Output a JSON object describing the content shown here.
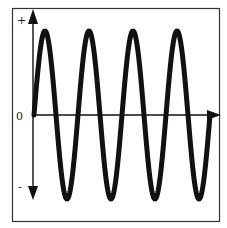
{
  "diagram": {
    "title": "",
    "type": "sine-wave",
    "y_labels": {
      "top": "+",
      "middle": "0",
      "bottom": "-"
    },
    "cycles": 4,
    "amplitude": 1,
    "start_phase": "rising from zero",
    "colors": {
      "wave": "#111111",
      "axis": "#111111",
      "frame": "#333333",
      "background": "#ffffff"
    }
  },
  "chart_data": {
    "type": "line",
    "title": "",
    "xlabel": "",
    "ylabel": "",
    "y_tick_labels": [
      "+",
      "0",
      "-"
    ],
    "ylim": [
      -1,
      1
    ],
    "series": [
      {
        "name": "sine",
        "function": "sin",
        "cycles": 4,
        "amplitude": 1
      }
    ]
  }
}
